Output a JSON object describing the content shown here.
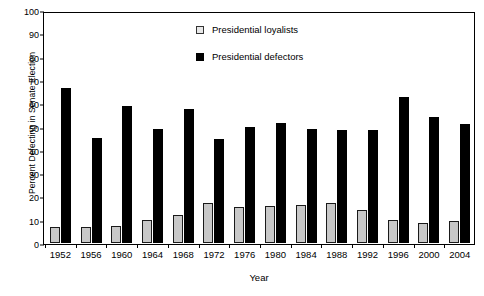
{
  "chart_data": {
    "type": "bar",
    "title": "",
    "xlabel": "Year",
    "ylabel": "Percent Defecting in Senate Election",
    "ylim": [
      0,
      100
    ],
    "ytick_step": 10,
    "yticks": [
      0,
      10,
      20,
      30,
      40,
      50,
      60,
      70,
      80,
      90,
      100
    ],
    "grid": false,
    "legend_position": "top-center",
    "categories": [
      "1952",
      "1956",
      "1960",
      "1964",
      "1968",
      "1972",
      "1976",
      "1980",
      "1984",
      "1988",
      "1992",
      "1996",
      "2000",
      "2004"
    ],
    "series": [
      {
        "name": "Presidential loyalists",
        "color": "#c8c8c8",
        "values": [
          7,
          7,
          7.5,
          10,
          12,
          17,
          15.5,
          16,
          16.5,
          17,
          14,
          10,
          8.5,
          9.5
        ]
      },
      {
        "name": "Presidential defectors",
        "color": "#000000",
        "values": [
          66.5,
          45,
          59,
          49,
          57.5,
          44.5,
          50,
          51.5,
          49,
          48.5,
          48.5,
          62.5,
          54,
          51
        ]
      }
    ]
  },
  "legend": {
    "items": [
      {
        "label": "Presidential loyalists",
        "swatch": "loyalist-swatch"
      },
      {
        "label": "Presidential defectors",
        "swatch": "defector-swatch"
      }
    ]
  }
}
